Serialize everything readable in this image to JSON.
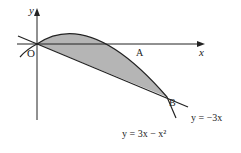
{
  "diagram": {
    "type": "graph-region",
    "labels": {
      "y_axis": "y",
      "x_axis": "x",
      "origin": "O",
      "point_a": "A",
      "point_b": "B",
      "line_eq": "y = −3x",
      "curve_eq": "y = 3x − x²"
    },
    "colors": {
      "shade": "#b5b5b5",
      "stroke": "#222222"
    }
  }
}
